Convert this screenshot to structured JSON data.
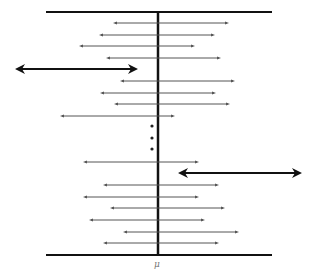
{
  "diagram": {
    "colors": {
      "axis": "#111111",
      "interval": "#555555",
      "miss_interval": "#111111",
      "label": "#777777",
      "dots": "#222222"
    },
    "top_line": {
      "x1": 46,
      "x2": 272,
      "y": 12
    },
    "bottom_line": {
      "x1": 46,
      "x2": 272,
      "y": 255
    },
    "mean_line": {
      "x": 158,
      "y1": 12,
      "y2": 255
    },
    "mean_label": {
      "text": "μ",
      "x": 157,
      "y": 259
    },
    "intervals": [
      {
        "x1": 113,
        "x2": 229,
        "y": 23,
        "contains_mean": true
      },
      {
        "x1": 99,
        "x2": 215,
        "y": 35,
        "contains_mean": true
      },
      {
        "x1": 79,
        "x2": 195,
        "y": 46,
        "contains_mean": true
      },
      {
        "x1": 106,
        "x2": 221,
        "y": 58,
        "contains_mean": true
      },
      {
        "x1": 15,
        "x2": 138,
        "y": 69,
        "contains_mean": false
      },
      {
        "x1": 120,
        "x2": 235,
        "y": 81,
        "contains_mean": true
      },
      {
        "x1": 100,
        "x2": 216,
        "y": 93,
        "contains_mean": true
      },
      {
        "x1": 114,
        "x2": 230,
        "y": 104,
        "contains_mean": true
      },
      {
        "x1": 60,
        "x2": 175,
        "y": 116,
        "contains_mean": true
      },
      {
        "x1": 83,
        "x2": 199,
        "y": 162,
        "contains_mean": true
      },
      {
        "x1": 178,
        "x2": 302,
        "y": 173,
        "contains_mean": false
      },
      {
        "x1": 103,
        "x2": 219,
        "y": 185,
        "contains_mean": true
      },
      {
        "x1": 83,
        "x2": 199,
        "y": 197,
        "contains_mean": true
      },
      {
        "x1": 110,
        "x2": 225,
        "y": 208,
        "contains_mean": true
      },
      {
        "x1": 89,
        "x2": 205,
        "y": 220,
        "contains_mean": true
      },
      {
        "x1": 123,
        "x2": 239,
        "y": 232,
        "contains_mean": true
      },
      {
        "x1": 103,
        "x2": 219,
        "y": 243,
        "contains_mean": true
      }
    ],
    "ellipsis_dots": [
      {
        "x": 152,
        "y": 126
      },
      {
        "x": 152,
        "y": 138
      },
      {
        "x": 152,
        "y": 149
      }
    ]
  }
}
